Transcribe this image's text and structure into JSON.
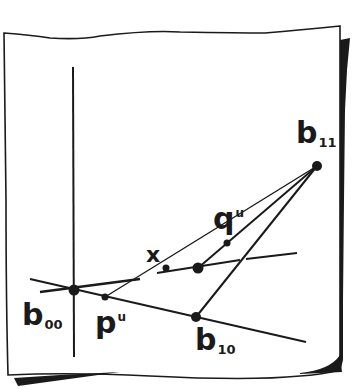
{
  "figure": {
    "ink_color": "#1a1a1a",
    "paper_color": "#ffffff"
  },
  "labels": {
    "b00": {
      "main": "b",
      "sub": "00"
    },
    "p_u": {
      "main": "p",
      "sup": "u"
    },
    "b10": {
      "main": "b",
      "sub": "10"
    },
    "b11": {
      "main": "b",
      "sub": "11"
    },
    "q_u": {
      "main": "q",
      "sup": "u"
    },
    "x": {
      "main": "x"
    }
  },
  "points": [
    {
      "id": "b00",
      "x": 74,
      "y": 290
    },
    {
      "id": "p_u",
      "x": 105,
      "y": 297
    },
    {
      "id": "x_point",
      "x": 166,
      "y": 268
    },
    {
      "id": "center",
      "x": 198,
      "y": 268
    },
    {
      "id": "q_u",
      "x": 227,
      "y": 243
    },
    {
      "id": "b10",
      "x": 196,
      "y": 317
    },
    {
      "id": "b11",
      "x": 317,
      "y": 166
    }
  ]
}
